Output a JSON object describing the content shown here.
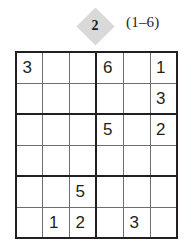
{
  "puzzle": {
    "badge_number": "2",
    "range_label": "(1–6)",
    "badge_color": "#d9d9d9",
    "grid_line_color": "#231f20",
    "digit_color": "#231f20",
    "size": 6,
    "box_width": 3,
    "box_height": 2,
    "rows": [
      [
        "3",
        "",
        "",
        "6",
        "",
        "1"
      ],
      [
        "",
        "",
        "",
        "",
        "",
        "3"
      ],
      [
        "",
        "",
        "",
        "5",
        "",
        "2"
      ],
      [
        "",
        "",
        "",
        "",
        "",
        ""
      ],
      [
        "",
        "",
        "5",
        "",
        "",
        ""
      ],
      [
        "",
        "1",
        "2",
        "",
        "3",
        ""
      ]
    ]
  }
}
